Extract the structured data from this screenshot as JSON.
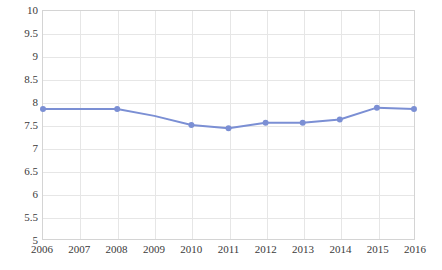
{
  "chart_data": {
    "type": "line",
    "title": "",
    "subtitle": "",
    "xlabel": "",
    "ylabel": "",
    "categories": [
      "2006",
      "2007",
      "2008",
      "2009",
      "2010",
      "2011",
      "2012",
      "2013",
      "2014",
      "2015",
      "2016"
    ],
    "x": [
      2006,
      2007,
      2008,
      2009,
      2010,
      2011,
      2012,
      2013,
      2014,
      2015,
      2016
    ],
    "values": [
      7.85,
      7.85,
      7.85,
      7.7,
      7.5,
      7.43,
      7.55,
      7.55,
      7.62,
      7.88,
      7.85
    ],
    "markers_shown": [
      true,
      false,
      true,
      false,
      true,
      true,
      true,
      true,
      true,
      true,
      true
    ],
    "ylim": [
      5,
      10
    ],
    "ytick_values": [
      5,
      5.5,
      6,
      6.5,
      7,
      7.5,
      8,
      8.5,
      9,
      9.5,
      10
    ],
    "ytick_labels": [
      "5",
      "5.5",
      "6",
      "6.5",
      "7",
      "7.5",
      "8",
      "8.5",
      "9",
      "9.5",
      "10"
    ],
    "xlim": [
      2006,
      2016
    ],
    "grid": {
      "horizontal": true,
      "vertical": true,
      "color": "#e6e6e6"
    },
    "legend": {
      "visible": false,
      "position": "none"
    },
    "series": [
      {
        "name": "series-1",
        "color": "#7b8fd4",
        "marker_color": "#7b8fd4",
        "line_width": 2,
        "marker_size": 6,
        "values": [
          7.85,
          7.85,
          7.85,
          7.7,
          7.5,
          7.43,
          7.55,
          7.55,
          7.62,
          7.88,
          7.85
        ]
      }
    ],
    "frame_color": "#d4d4d4",
    "background": "#ffffff",
    "tick_label_color": "#3a3a3a"
  }
}
